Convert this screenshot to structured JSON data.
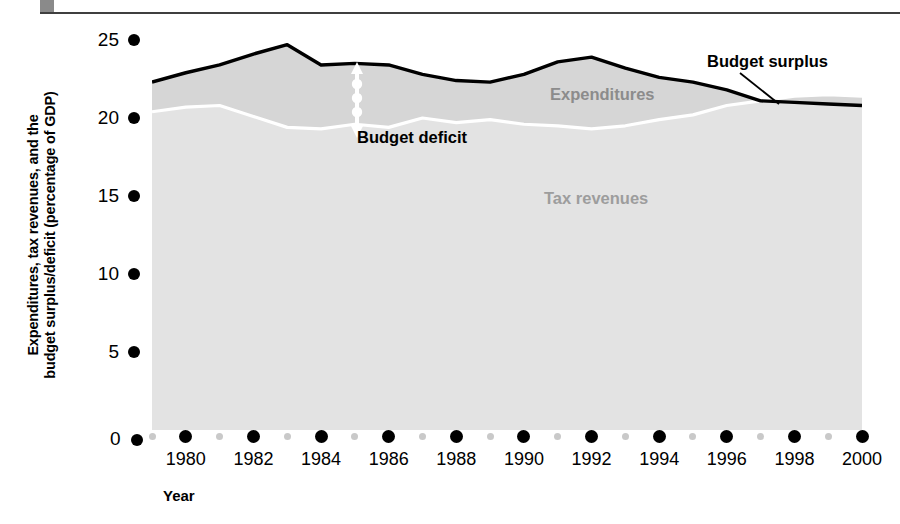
{
  "figure": {
    "y_axis_title": "Expenditures, tax revenues, and the\nbudget surplus/deficit (percentage of GDP)",
    "x_axis_title": "Year",
    "zero_label": "0"
  },
  "annotations": {
    "expenditures": "Expenditures",
    "tax_revenues": "Tax revenues",
    "budget_deficit": "Budget deficit",
    "budget_surplus": "Budget surplus"
  },
  "colors": {
    "expenditures_line": "#000000",
    "tax_revenues_line": "#ffffff",
    "deficit_fill": "#d8d8d8",
    "revenue_fill": "#e0e0e0",
    "expenditures_label": "#8c8c8c",
    "tax_revenues_label": "#9d9d9d",
    "major_tick_dot": "#000000",
    "minor_tick_dot": "#c9c9c9",
    "rule": "#3f3f3f",
    "corner_block": "#8a8a8a"
  },
  "chart_data": {
    "type": "area",
    "title": "",
    "xlabel": "Year",
    "ylabel": "Expenditures, tax revenues, and the budget surplus/deficit (percentage of GDP)",
    "xlim": [
      1979,
      2000
    ],
    "ylim": [
      0,
      25
    ],
    "yticks": [
      0,
      5,
      10,
      15,
      20,
      25
    ],
    "ytick_labels": [
      "0",
      "5",
      "10",
      "15",
      "20",
      "25"
    ],
    "xticks": [
      1980,
      1982,
      1984,
      1986,
      1988,
      1990,
      1992,
      1994,
      1996,
      1998,
      2000
    ],
    "xtick_labels": [
      "1980",
      "1982",
      "1984",
      "1986",
      "1988",
      "1990",
      "1992",
      "1994",
      "1996",
      "1998",
      "2000"
    ],
    "minor_xticks": [
      1979,
      1981,
      1983,
      1985,
      1987,
      1989,
      1991,
      1993,
      1995,
      1997,
      1999
    ],
    "grid": false,
    "legend": "inline-labels",
    "x": [
      1979,
      1980,
      1981,
      1982,
      1983,
      1984,
      1985,
      1986,
      1987,
      1988,
      1989,
      1990,
      1991,
      1992,
      1993,
      1994,
      1995,
      1996,
      1997,
      1998,
      1999,
      2000
    ],
    "series": [
      {
        "name": "Expenditures",
        "values": [
          22.3,
          22.9,
          23.4,
          24.1,
          24.7,
          23.4,
          23.5,
          23.4,
          22.8,
          22.4,
          22.3,
          22.8,
          23.6,
          23.9,
          23.2,
          22.6,
          22.3,
          21.8,
          21.1,
          21.0,
          20.9,
          20.8
        ]
      },
      {
        "name": "Tax revenues",
        "values": [
          20.4,
          20.7,
          20.8,
          20.1,
          19.4,
          19.3,
          19.6,
          19.4,
          20.0,
          19.7,
          19.9,
          19.6,
          19.5,
          19.3,
          19.5,
          19.9,
          20.2,
          20.8,
          21.1,
          21.4,
          21.5,
          21.4
        ]
      }
    ],
    "derived": {
      "budget_deficit_years": [
        1979,
        1996
      ],
      "budget_surplus_years": [
        1997,
        2000
      ],
      "crossover_year": 1997
    }
  }
}
